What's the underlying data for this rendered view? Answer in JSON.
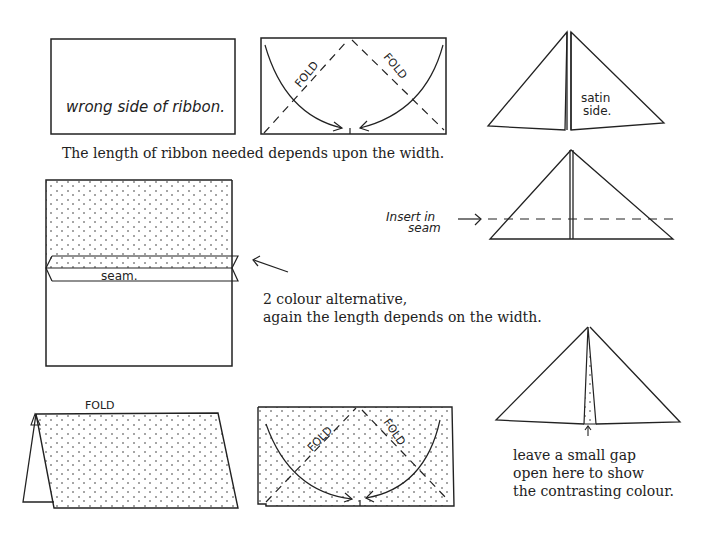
{
  "captions": {
    "length_note": "The length of ribbon needed depends upon the width.",
    "two_colour_line1": "2 colour alternative,",
    "two_colour_line2": "again the length depends on the width.",
    "gap_line1": "leave a small gap",
    "gap_line2": "open here to show",
    "gap_line3": "the contrasting colour."
  },
  "labels": {
    "wrong_side": "wrong side of ribbon.",
    "fold": "FOLD",
    "satin_line1": "satin",
    "satin_line2": "side.",
    "insert_line1": "Insert in",
    "insert_line2": "seam",
    "seam": "seam."
  },
  "colors": {
    "ink": "#222222",
    "paper": "#ffffff"
  }
}
